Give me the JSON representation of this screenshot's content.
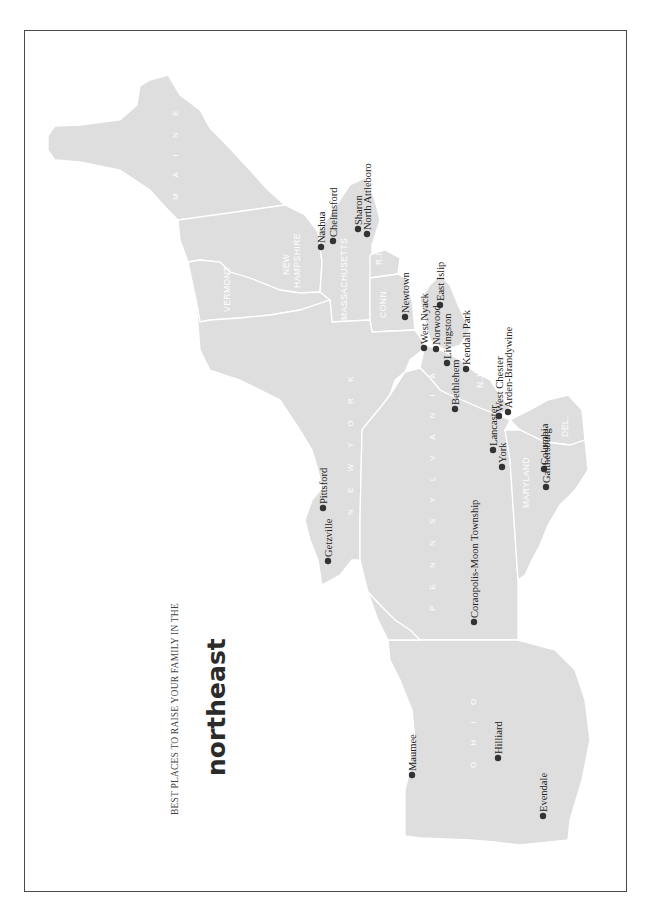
{
  "header": {
    "subtitle": "BEST PLACES TO RAISE YOUR FAMILY IN THE",
    "title": "northeast"
  },
  "colors": {
    "land": "#dedede",
    "border": "#ffffff",
    "frame": "#4a4a4a",
    "dot": "#333333",
    "text": "#222222"
  },
  "states": [
    {
      "id": "maine",
      "label": "M A I N E"
    },
    {
      "id": "new-hampshire",
      "label_line1": "NEW",
      "label_line2": "HAMPSHIRE"
    },
    {
      "id": "vermont",
      "label": "VERMONT"
    },
    {
      "id": "massachusetts",
      "label": "MASSACHUSETTS"
    },
    {
      "id": "rhode-island",
      "label": "R.I."
    },
    {
      "id": "connecticut",
      "label": "CONN."
    },
    {
      "id": "new-york",
      "label": "N E W   Y O R K"
    },
    {
      "id": "new-jersey",
      "label": "N.J."
    },
    {
      "id": "pennsylvania",
      "label": "P E N N S Y L V A N I A"
    },
    {
      "id": "delaware",
      "label": "DEL."
    },
    {
      "id": "maryland",
      "label": "MARYLAND"
    },
    {
      "id": "ohio",
      "label": "O H I O"
    }
  ],
  "cities": [
    {
      "name": "Chelmsford",
      "x": 333,
      "y": 241
    },
    {
      "name": "Sharon",
      "x": 358,
      "y": 229
    },
    {
      "name": "North Attleboro",
      "x": 367,
      "y": 234
    },
    {
      "name": "Nashua",
      "x": 321,
      "y": 247
    },
    {
      "name": "Newtown",
      "x": 405,
      "y": 317
    },
    {
      "name": "East Islip",
      "x": 440,
      "y": 305
    },
    {
      "name": "West Nyack",
      "x": 424,
      "y": 348
    },
    {
      "name": "Norwood",
      "x": 436,
      "y": 349
    },
    {
      "name": "Kendall Park",
      "x": 466,
      "y": 369
    },
    {
      "name": "Livingston",
      "x": 447,
      "y": 363
    },
    {
      "name": "Bethlehem",
      "x": 455,
      "y": 409
    },
    {
      "name": "West Chester",
      "x": 499,
      "y": 416
    },
    {
      "name": "Arden-Brandywine",
      "x": 508,
      "y": 412
    },
    {
      "name": "Lancaster",
      "x": 493,
      "y": 450
    },
    {
      "name": "York",
      "x": 502,
      "y": 467
    },
    {
      "name": "Columbia",
      "x": 544,
      "y": 469
    },
    {
      "name": "Gaithersburg",
      "x": 546,
      "y": 487
    },
    {
      "name": "Pittsford",
      "x": 323,
      "y": 508
    },
    {
      "name": "Getzville",
      "x": 328,
      "y": 561
    },
    {
      "name": "Coraopolis-Moon Township",
      "x": 474,
      "y": 622
    },
    {
      "name": "Maumee",
      "x": 412,
      "y": 775
    },
    {
      "name": "Hilliard",
      "x": 498,
      "y": 758
    },
    {
      "name": "Evendale",
      "x": 543,
      "y": 816
    }
  ]
}
